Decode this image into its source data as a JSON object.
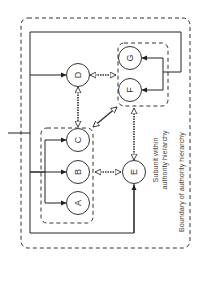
{
  "diagram": {
    "colors": {
      "line": "#222222",
      "dashed": "#333333",
      "text": "#444444",
      "background": "#ffffff"
    },
    "nodes": [
      {
        "id": "A",
        "label": "A",
        "cx": 78,
        "cy": 203
      },
      {
        "id": "B",
        "label": "B",
        "cx": 78,
        "cy": 172
      },
      {
        "id": "C",
        "label": "C",
        "cx": 78,
        "cy": 140
      },
      {
        "id": "D",
        "label": "D",
        "cx": 78,
        "cy": 75
      },
      {
        "id": "E",
        "label": "E",
        "cx": 134,
        "cy": 172
      },
      {
        "id": "F",
        "label": "F",
        "cx": 130,
        "cy": 90
      },
      {
        "id": "G",
        "label": "G",
        "cx": 130,
        "cy": 58
      }
    ],
    "groups": [
      {
        "id": "subunit-abc",
        "members": [
          "A",
          "B",
          "C"
        ]
      },
      {
        "id": "subunit-fg",
        "members": [
          "F",
          "G"
        ]
      }
    ],
    "labels": {
      "subunit_line1": "Subunit within",
      "subunit_line2": "authority hierarchy",
      "boundary": "Boundary of authority hierarchy"
    },
    "edges_directed": [
      {
        "from": "input",
        "to": "subunit-abc"
      },
      {
        "from": "bracket-abc",
        "to": "A"
      },
      {
        "from": "bracket-abc",
        "to": "B"
      },
      {
        "from": "bracket-abc",
        "to": "C"
      },
      {
        "from": "feedback",
        "to": "D"
      },
      {
        "from": "feedback",
        "to": "E"
      },
      {
        "from": "bracket-fg",
        "to": "F"
      },
      {
        "from": "bracket-fg",
        "to": "G"
      }
    ],
    "edges_bidirectional": [
      {
        "a": "D",
        "b": "subunit-fg"
      },
      {
        "a": "D",
        "b": "C"
      },
      {
        "a": "subunit-abc",
        "b": "subunit-fg"
      },
      {
        "a": "B",
        "b": "E"
      },
      {
        "a": "E",
        "b": "subunit-fg"
      }
    ]
  }
}
